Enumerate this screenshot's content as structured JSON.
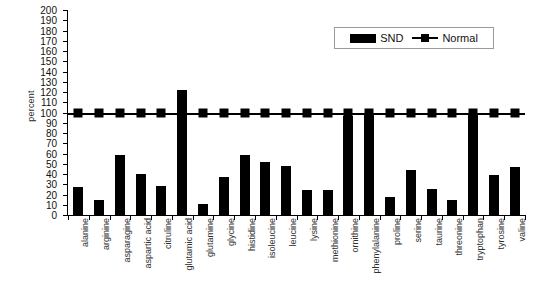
{
  "chart_data": {
    "type": "bar",
    "title": "",
    "xlabel": "",
    "ylabel": "percent",
    "ylim": [
      0,
      200
    ],
    "ytick_step": 10,
    "grid": false,
    "legend_position": "top-right",
    "categories": [
      "alanine",
      "arginine",
      "asparagine",
      "aspartic acid",
      "citruline",
      "glutamic acid",
      "glutamine",
      "glycine",
      "histidine",
      "isoleucine",
      "leucine",
      "lysine",
      "methionine",
      "ornithine",
      "phenylalanine",
      "proline",
      "serine",
      "taurine",
      "threonine",
      "tryptophan",
      "tyrosine",
      "valine"
    ],
    "ytick_labels": [
      "0",
      "10",
      "20",
      "30",
      "40",
      "50",
      "60",
      "70",
      "80",
      "90",
      "100",
      "110",
      "120",
      "130",
      "140",
      "150",
      "160",
      "170",
      "180",
      "190",
      "200"
    ],
    "series": [
      {
        "name": "SND",
        "type": "bar",
        "color": "#000000",
        "values": [
          27,
          15,
          59,
          40,
          28,
          122,
          11,
          37,
          59,
          52,
          48,
          24,
          24,
          97,
          100,
          18,
          44,
          25,
          15,
          98,
          39,
          47
        ]
      },
      {
        "name": "Normal",
        "type": "line",
        "color": "#000000",
        "marker": "square",
        "values": [
          100,
          100,
          100,
          100,
          100,
          100,
          100,
          100,
          100,
          100,
          100,
          100,
          100,
          100,
          100,
          100,
          100,
          100,
          100,
          100,
          100,
          100
        ]
      }
    ]
  },
  "legend": {
    "items": [
      {
        "label": "SND",
        "swatch": "bar-swatch"
      },
      {
        "label": "Normal",
        "swatch": "line-marker-swatch"
      }
    ]
  }
}
